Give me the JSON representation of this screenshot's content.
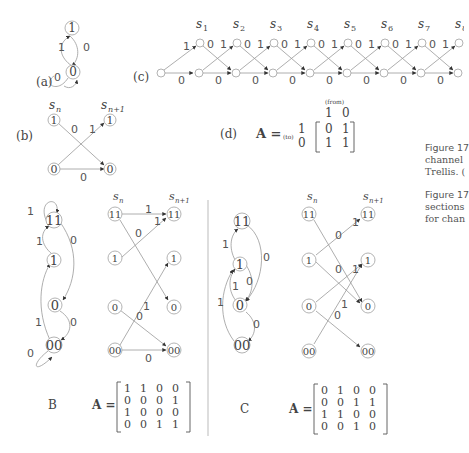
{
  "figure": {
    "panel_a": {
      "label": "(a)",
      "nodes": [
        "1",
        "0"
      ],
      "edges": [
        {
          "from": "1",
          "to": "0",
          "label": "0"
        },
        {
          "from": "0",
          "to": "1",
          "label": "1"
        },
        {
          "from": "0",
          "to": "0",
          "label": "0"
        }
      ]
    },
    "panel_b": {
      "label": "(b)",
      "col_left": "s",
      "col_left_sub": "n",
      "col_right": "s",
      "col_right_sub": "n+1",
      "nodes_left": [
        "1",
        "0"
      ],
      "nodes_right": [
        "1",
        "0"
      ],
      "edge_labels": {
        "cross_down": "0",
        "cross_up": "1",
        "bottom": "0"
      }
    },
    "panel_c": {
      "label": "(c)",
      "stages": [
        "s1",
        "s2",
        "s3",
        "s4",
        "s5",
        "s6",
        "s7",
        "s8"
      ],
      "stage_sym": "s",
      "stage_subs": [
        "1",
        "2",
        "3",
        "4",
        "5",
        "6",
        "7",
        "8"
      ],
      "node_top": "1",
      "node_bottom": "0",
      "label_up": "1",
      "label_down": "0",
      "label_flat": "0"
    },
    "panel_d": {
      "label": "(d)",
      "lhs": "A =",
      "from_label": "(from)",
      "to_label": "(to)",
      "col_headers": [
        "1",
        "0"
      ],
      "row_headers": [
        "1",
        "0"
      ],
      "matrix": [
        [
          "0",
          "1"
        ],
        [
          "1",
          "1"
        ]
      ]
    },
    "panel_B": {
      "label": "B",
      "lhs": "A =",
      "col_left": "s",
      "col_left_sub": "n",
      "col_right": "s",
      "col_right_sub": "n+1",
      "states": [
        "11",
        "1",
        "0",
        "00"
      ],
      "graph_edge_labels": {
        "self_11": "1",
        "one_to_11": "1",
        "11_to_0": "0",
        "zero_to_00": "0",
        "00_to_1": "1",
        "self_00": "0"
      },
      "trellis_labels": {
        "11_11": "1",
        "1_11": "1",
        "11_0": "0",
        "00_1": "1",
        "0_00": "0",
        "00_00": "0"
      },
      "matrix": [
        [
          "1",
          "1",
          "0",
          "0"
        ],
        [
          "0",
          "0",
          "0",
          "1"
        ],
        [
          "1",
          "0",
          "0",
          "0"
        ],
        [
          "0",
          "0",
          "1",
          "1"
        ]
      ]
    },
    "panel_C": {
      "label": "C",
      "lhs": "A =",
      "col_left": "s",
      "col_left_sub": "n",
      "col_right": "s",
      "col_right_sub": "n+1",
      "states": [
        "11",
        "1",
        "0",
        "00"
      ],
      "graph_edge_labels": {
        "one_to_11": "1",
        "11_to_0": "0",
        "one_to_0": "0",
        "zero_to_1": "1",
        "00_to_1": "1",
        "zero_to_00": "0"
      },
      "trellis_labels": {
        "1_11": "1",
        "11_0": "0",
        "1_0": "0",
        "0_1": "1",
        "00_1": "1",
        "0_00": "0"
      },
      "matrix": [
        [
          "0",
          "1",
          "0",
          "0"
        ],
        [
          "0",
          "0",
          "1",
          "1"
        ],
        [
          "1",
          "1",
          "0",
          "0"
        ],
        [
          "0",
          "0",
          "1",
          "0"
        ]
      ]
    },
    "captions": {
      "cap1": [
        "Figure 17",
        "channel",
        "Trellis. ("
      ],
      "cap2": [
        "Figure 17",
        "sections",
        "for chan"
      ]
    }
  }
}
